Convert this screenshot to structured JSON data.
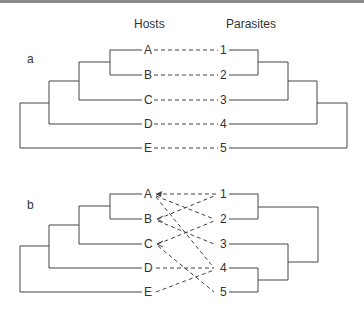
{
  "headers": {
    "hosts": "Hosts",
    "parasites": "Parasites"
  },
  "panels": [
    {
      "label": "a",
      "hosts": [
        "A",
        "B",
        "C",
        "D",
        "E"
      ],
      "parasites": [
        "1",
        "2",
        "3",
        "4",
        "5"
      ],
      "links": [
        [
          "A",
          "1"
        ],
        [
          "B",
          "2"
        ],
        [
          "C",
          "3"
        ],
        [
          "D",
          "4"
        ],
        [
          "E",
          "5"
        ]
      ]
    },
    {
      "label": "b",
      "hosts": [
        "A",
        "B",
        "C",
        "D",
        "E"
      ],
      "parasites": [
        "1",
        "2",
        "3",
        "4",
        "5"
      ],
      "links": [
        [
          "A",
          "1"
        ],
        [
          "A",
          "2"
        ],
        [
          "A",
          "4"
        ],
        [
          "B",
          "1"
        ],
        [
          "B",
          "3"
        ],
        [
          "C",
          "2"
        ],
        [
          "C",
          "5"
        ],
        [
          "D",
          "4"
        ],
        [
          "E",
          "4"
        ]
      ]
    }
  ]
}
